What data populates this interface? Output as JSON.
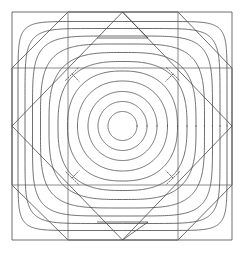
{
  "figure": {
    "width": 245,
    "height": 254,
    "background_color": "#ffffff",
    "stroke_color": "#4a4a4a",
    "stroke_color_light": "#6e6e6e",
    "stroke_width": 0.8,
    "center": {
      "x": 122.5,
      "y": 126.0
    }
  },
  "chart_data": {
    "type": "line",
    "xlabel": "",
    "ylabel": "",
    "grid": false,
    "legend": null,
    "xlim": [
      -1.35,
      1.35
    ],
    "ylim": [
      -1.35,
      1.35
    ],
    "center": {
      "x": 122.5,
      "y": 126.0
    },
    "scale_px_per_unit": 88.0,
    "levels": [
      {
        "index": 1,
        "radius_units": 0.165,
        "radius_px": 14.5,
        "shape_exponent": 2.0,
        "kind": "circle"
      },
      {
        "index": 2,
        "radius_units": 0.278,
        "radius_px": 24.5,
        "shape_exponent": 2.0,
        "kind": "circle"
      },
      {
        "index": 3,
        "radius_units": 0.392,
        "radius_px": 34.5,
        "shape_exponent": 2.05,
        "kind": "circle"
      },
      {
        "index": 4,
        "radius_units": 0.511,
        "radius_px": 45.0,
        "shape_exponent": 2.15,
        "kind": "near-circle"
      },
      {
        "index": 5,
        "radius_units": 0.625,
        "radius_px": 55.0,
        "shape_exponent": 2.35,
        "kind": "rounded-square"
      },
      {
        "index": 6,
        "radius_units": 0.733,
        "radius_px": 64.5,
        "shape_exponent": 2.7,
        "kind": "rounded-square"
      },
      {
        "index": 7,
        "radius_units": 0.835,
        "radius_px": 73.5,
        "shape_exponent": 3.2,
        "kind": "rounded-square"
      },
      {
        "index": 8,
        "radius_units": 0.932,
        "radius_px": 82.0,
        "shape_exponent": 4.0,
        "kind": "rounded-square"
      },
      {
        "index": 9,
        "radius_units": 1.023,
        "radius_px": 90.0,
        "shape_exponent": 5.2,
        "kind": "squarish"
      },
      {
        "index": 10,
        "radius_units": 1.108,
        "radius_px": 97.5,
        "shape_exponent": 7.0,
        "kind": "squarish"
      },
      {
        "index": 11,
        "radius_units": 1.188,
        "radius_px": 104.5,
        "shape_exponent": 9.5,
        "kind": "octagonal"
      }
    ],
    "saddle_points": [
      {
        "x_px": 72.0,
        "y_px": 74.0,
        "quadrant": "top-left",
        "style": "dashed"
      },
      {
        "x_px": 173.0,
        "y_px": 74.0,
        "quadrant": "top-right",
        "style": "dashed"
      },
      {
        "x_px": 72.0,
        "y_px": 178.0,
        "quadrant": "bottom-left",
        "style": "dashed"
      },
      {
        "x_px": 173.0,
        "y_px": 178.0,
        "quadrant": "bottom-right",
        "style": "dashed"
      }
    ],
    "separatrix_branches": 4,
    "annotations": []
  },
  "geometry": {
    "outer_octagon": {
      "name": "outer-octagon",
      "corner_cut_px": 56,
      "points": [
        {
          "x": 68,
          "y": 12
        },
        {
          "x": 178,
          "y": 12
        },
        {
          "x": 232,
          "y": 68
        },
        {
          "x": 232,
          "y": 185
        },
        {
          "x": 178,
          "y": 240
        },
        {
          "x": 68,
          "y": 240
        },
        {
          "x": 12,
          "y": 185
        },
        {
          "x": 12,
          "y": 68
        }
      ]
    },
    "bounding_square": {
      "name": "bounding-square",
      "left": 12,
      "top": 12,
      "right": 232,
      "bottom": 240
    },
    "inner_diamond": {
      "name": "inner-diamond",
      "points": [
        {
          "x": 122.5,
          "y": 12
        },
        {
          "x": 232,
          "y": 126
        },
        {
          "x": 122.5,
          "y": 240
        },
        {
          "x": 12,
          "y": 126
        }
      ]
    },
    "inner_square_grid": {
      "name": "inner-square-grid",
      "left": 68,
      "top": 68,
      "right": 178,
      "bottom": 185
    },
    "small_triangles": [
      {
        "name": "top-triangle",
        "points": [
          {
            "x": 97,
            "y": 38
          },
          {
            "x": 148,
            "y": 38
          },
          {
            "x": 122.5,
            "y": 12
          }
        ]
      },
      {
        "name": "bottom-triangle",
        "points": [
          {
            "x": 97,
            "y": 222
          },
          {
            "x": 148,
            "y": 222
          },
          {
            "x": 122.5,
            "y": 240
          }
        ]
      }
    ]
  }
}
